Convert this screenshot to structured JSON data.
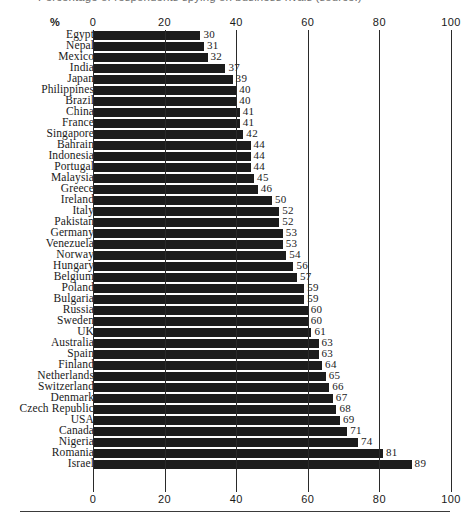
{
  "title": "Percentage of respondents spying on business rivals (source:)",
  "axis": {
    "unit_label": "%",
    "ticks": [
      0,
      20,
      40,
      60,
      80,
      100
    ],
    "min": 0,
    "max": 100
  },
  "chart_data": {
    "type": "bar",
    "orientation": "horizontal",
    "title": "Percentage of respondents spying on business rivals (source:)",
    "xlabel": "%",
    "ylabel": "",
    "xlim": [
      0,
      100
    ],
    "xticks": [
      0,
      20,
      40,
      60,
      80,
      100
    ],
    "grid": true,
    "legend": false,
    "bar_color": "#1c1c1c",
    "value_labels": true,
    "sort": "ascending",
    "categories": [
      "Egypt",
      "Nepal",
      "Mexico",
      "India",
      "Japan",
      "Philippines",
      "Brazil",
      "China",
      "France",
      "Singapore",
      "Bahrain",
      "Indonesia",
      "Portugal",
      "Malaysia",
      "Greece",
      "Ireland",
      "Italy",
      "Pakistan",
      "Germany",
      "Venezuela",
      "Norway",
      "Hungary",
      "Belgium",
      "Poland",
      "Bulgaria",
      "Russia",
      "Sweden",
      "UK",
      "Australia",
      "Spain",
      "Finland",
      "Netherlands",
      "Switzerland",
      "Denmark",
      "Czech Republic",
      "USA",
      "Canada",
      "Nigeria",
      "Romania",
      "Israel"
    ],
    "values": [
      30,
      31,
      32,
      37,
      39,
      40,
      40,
      41,
      41,
      42,
      44,
      44,
      44,
      45,
      46,
      50,
      52,
      52,
      53,
      53,
      54,
      56,
      57,
      59,
      59,
      60,
      60,
      61,
      63,
      63,
      64,
      65,
      66,
      67,
      68,
      69,
      71,
      74,
      81,
      89
    ]
  }
}
